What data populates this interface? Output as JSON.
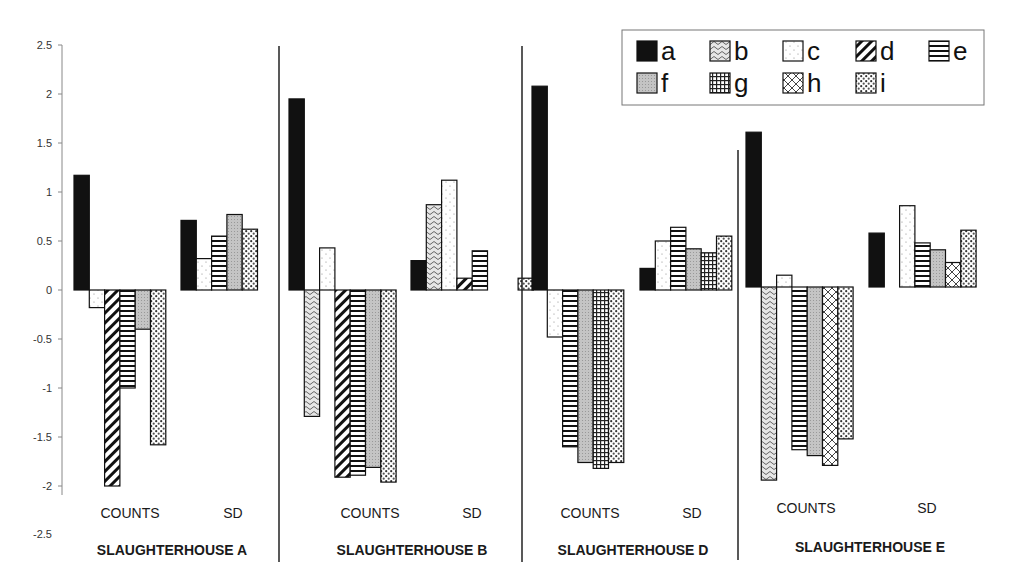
{
  "chart_data": {
    "type": "bar",
    "title": "",
    "xlabel": "",
    "ylabel": "",
    "ylim": [
      -2.5,
      2.5
    ],
    "yticks": [
      2.5,
      2,
      1.5,
      1,
      0.5,
      0,
      -0.5,
      -1,
      -1.5,
      -2,
      -2.5
    ],
    "ytick_labels": [
      "2.5",
      "2",
      "1.5",
      "1",
      "0.5",
      "0",
      "-0.5",
      "-1",
      "-1.5",
      "-2",
      "-2.5"
    ],
    "grid": false,
    "legend_position": "top-right",
    "legend": [
      {
        "key": "a",
        "label": "a",
        "pattern": "solid-black"
      },
      {
        "key": "b",
        "label": "b",
        "pattern": "wavy"
      },
      {
        "key": "c",
        "label": "c",
        "pattern": "sparse-dots"
      },
      {
        "key": "d",
        "label": "d",
        "pattern": "diagonal-stripes"
      },
      {
        "key": "e",
        "label": "e",
        "pattern": "horizontal-stripes"
      },
      {
        "key": "f",
        "label": "f",
        "pattern": "gray-fine"
      },
      {
        "key": "g",
        "label": "g",
        "pattern": "grid"
      },
      {
        "key": "h",
        "label": "h",
        "pattern": "diamond-crosshatch"
      },
      {
        "key": "i",
        "label": "i",
        "pattern": "dense-dots"
      }
    ],
    "category_labels": [
      "COUNTS",
      "SD"
    ],
    "groups": [
      {
        "name": "SLAUGHTERHOUSE A",
        "counts": [
          {
            "series": "a",
            "value": 1.17
          },
          {
            "series": "c",
            "value": -0.18
          },
          {
            "series": "d",
            "value": -2.0
          },
          {
            "series": "e",
            "value": -1.0
          },
          {
            "series": "f",
            "value": -0.4
          },
          {
            "series": "i",
            "value": -1.58
          }
        ],
        "sd": [
          {
            "series": "a",
            "value": 0.71
          },
          {
            "series": "c",
            "value": 0.32
          },
          {
            "series": "e",
            "value": 0.55
          },
          {
            "series": "f",
            "value": 0.77
          },
          {
            "series": "i",
            "value": 0.62
          }
        ]
      },
      {
        "name": "SLAUGHTERHOUSE B",
        "counts": [
          {
            "series": "a",
            "value": 1.95
          },
          {
            "series": "b",
            "value": -1.29
          },
          {
            "series": "c",
            "value": 0.43
          },
          {
            "series": "d",
            "value": -1.91
          },
          {
            "series": "e",
            "value": -1.89
          },
          {
            "series": "f",
            "value": -1.81
          },
          {
            "series": "i",
            "value": -1.96
          }
        ],
        "sd": [
          {
            "series": "a",
            "value": 0.3
          },
          {
            "series": "b",
            "value": 0.87
          },
          {
            "series": "c",
            "value": 1.12
          },
          {
            "series": "d",
            "value": 0.12
          },
          {
            "series": "e",
            "value": 0.4
          },
          {
            "series": "i",
            "value": 0.12
          }
        ]
      },
      {
        "name": "SLAUGHTERHOUSE D",
        "counts": [
          {
            "series": "a",
            "value": 2.08
          },
          {
            "series": "c",
            "value": -0.48
          },
          {
            "series": "e",
            "value": -1.6
          },
          {
            "series": "f",
            "value": -1.76
          },
          {
            "series": "g",
            "value": -1.82
          },
          {
            "series": "i",
            "value": -1.76
          }
        ],
        "sd": [
          {
            "series": "a",
            "value": 0.22
          },
          {
            "series": "c",
            "value": 0.5
          },
          {
            "series": "e",
            "value": 0.64
          },
          {
            "series": "f",
            "value": 0.42
          },
          {
            "series": "g",
            "value": 0.38
          },
          {
            "series": "i",
            "value": 0.55
          }
        ]
      },
      {
        "name": "SLAUGHTERHOUSE E",
        "counts": [
          {
            "series": "a",
            "value": 1.58
          },
          {
            "series": "b",
            "value": -1.97
          },
          {
            "series": "c",
            "value": 0.12
          },
          {
            "series": "e",
            "value": -1.66
          },
          {
            "series": "f",
            "value": -1.72
          },
          {
            "series": "h",
            "value": -1.82
          },
          {
            "series": "i",
            "value": -1.55
          }
        ],
        "sd": [
          {
            "series": "a",
            "value": 0.55
          },
          {
            "series": "c",
            "value": 0.83
          },
          {
            "series": "e",
            "value": 0.45
          },
          {
            "series": "f",
            "value": 0.38
          },
          {
            "series": "h",
            "value": 0.25
          },
          {
            "series": "i",
            "value": 0.58
          }
        ]
      }
    ]
  },
  "layout_hints": {
    "colors": {
      "ink": "#111111",
      "axis": "#888888",
      "gray_fill": "#bdbdbd",
      "background": "#ffffff"
    }
  }
}
